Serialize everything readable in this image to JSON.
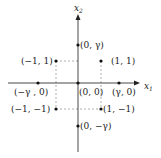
{
  "diagram": {
    "axes": {
      "x_label": "x",
      "x_subscript": "1",
      "y_label": "x",
      "y_subscript": "2"
    },
    "points": [
      {
        "id": "p-0-gamma",
        "label": "(0, γ)",
        "x": 78,
        "y": 45
      },
      {
        "id": "p-m1-1",
        "label": "(−1, 1)",
        "x": 56,
        "y": 61
      },
      {
        "id": "p-1-1",
        "label": "(1, 1)",
        "x": 101,
        "y": 61
      },
      {
        "id": "p-mgamma-0",
        "label": "(−γ , 0)",
        "x": 38,
        "y": 83
      },
      {
        "id": "p-0-0",
        "label": "(0, 0)",
        "x": 78,
        "y": 83
      },
      {
        "id": "p-gamma-0",
        "label": "(γ, 0)",
        "x": 119,
        "y": 83
      },
      {
        "id": "p-m1-m1",
        "label": "(−1, −1)",
        "x": 56,
        "y": 109
      },
      {
        "id": "p-1-m1",
        "label": "(1, −1)",
        "x": 101,
        "y": 109
      },
      {
        "id": "p-0-mgamma",
        "label": "(0, −γ)",
        "x": 78,
        "y": 126
      }
    ],
    "colors": {
      "axis": "#333333",
      "dashed": "#999999",
      "point": "#111111"
    }
  }
}
